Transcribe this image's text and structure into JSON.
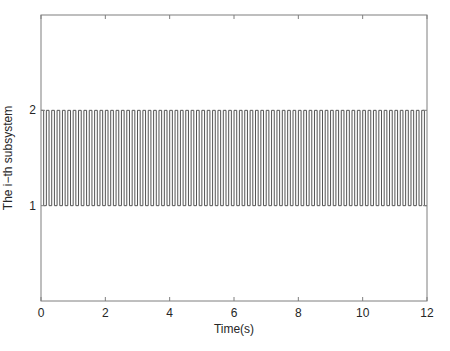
{
  "chart_data": {
    "type": "line",
    "subtype": "step",
    "title": "",
    "xlabel": "Time(s)",
    "ylabel": "The i−th subsystem",
    "xlim": [
      0,
      12
    ],
    "ylim": [
      0,
      3
    ],
    "xticks": [
      0,
      2,
      4,
      6,
      8,
      10,
      12
    ],
    "xtick_labels": [
      "0",
      "2",
      "4",
      "6",
      "8",
      "10",
      "12"
    ],
    "yticks": [
      1,
      2
    ],
    "ytick_labels": [
      "1",
      "2"
    ],
    "grid": false,
    "legend": null,
    "series": [
      {
        "name": "switching signal",
        "color": "#555555",
        "description": "Periodic square-wave switching between subsystem 2 and subsystem 1, starting at 2 at t=0, period approx. 1/6 s (about 72 cycles over 0-12 s), ~50% duty cycle",
        "levels": [
          2,
          1
        ],
        "start_level": 2,
        "period_s": 0.1667,
        "duty_high": 0.5,
        "t_start": 0,
        "t_end": 12
      }
    ],
    "colors": {
      "axes": "#7f7f7f",
      "line": "#555555",
      "text": "#262626",
      "background": "#ffffff"
    }
  }
}
